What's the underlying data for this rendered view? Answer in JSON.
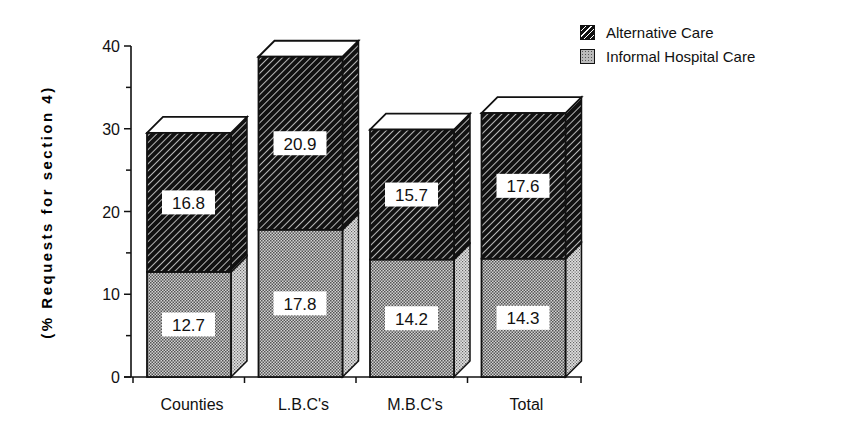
{
  "chart_data": {
    "type": "bar",
    "stacked": true,
    "style": "3d-stacked-column",
    "title": "",
    "xlabel": "",
    "ylabel": "(% Requests for section 4)",
    "ylim": [
      0,
      40
    ],
    "yticks": [
      0,
      10,
      20,
      30,
      40
    ],
    "grid": false,
    "legend_position": "top-right",
    "categories": [
      "Counties",
      "L.B.C's",
      "M.B.C's",
      "Total"
    ],
    "series": [
      {
        "name": "Informal Hospital Care",
        "pattern": "stipple",
        "color": "#b8b8b8",
        "values": [
          12.7,
          17.8,
          14.2,
          14.3
        ]
      },
      {
        "name": "Alternative Care",
        "pattern": "diagonal-hatch",
        "color": "#1a1a1a",
        "values": [
          16.8,
          20.9,
          15.7,
          17.6
        ]
      }
    ]
  },
  "legend": {
    "items": [
      {
        "label": "Alternative Care",
        "icon": "hatched-swatch"
      },
      {
        "label": "Informal Hospital Care",
        "icon": "stippled-swatch"
      }
    ]
  },
  "axes": {
    "y_label": "(% Requests for section 4)",
    "y_tick_labels": [
      "0",
      "10",
      "20",
      "30",
      "40"
    ],
    "x_tick_labels": [
      "Counties",
      "L.B.C's",
      "M.B.C's",
      "Total"
    ]
  }
}
